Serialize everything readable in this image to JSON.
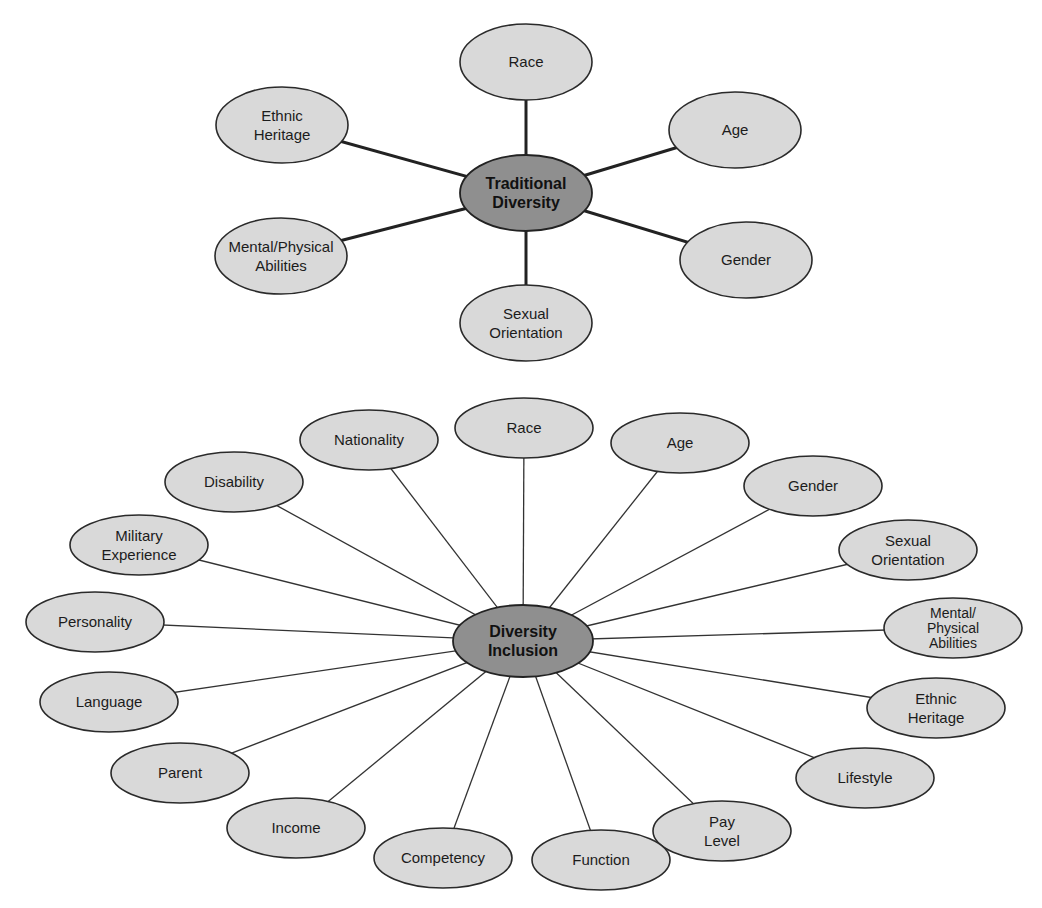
{
  "diagrams": [
    {
      "id": "traditional",
      "center": {
        "label": [
          "Traditional",
          "Diversity"
        ],
        "x": 526,
        "y": 193,
        "rx": 66,
        "ry": 38
      },
      "node_rx": 66,
      "node_ry": 38,
      "edge_style": "thick",
      "nodes": [
        {
          "label": [
            "Race"
          ],
          "x": 526,
          "y": 62
        },
        {
          "label": [
            "Ethnic",
            "Heritage"
          ],
          "x": 282,
          "y": 125
        },
        {
          "label": [
            "Age"
          ],
          "x": 735,
          "y": 130
        },
        {
          "label": [
            "Mental/Physical",
            "Abilities"
          ],
          "x": 281,
          "y": 256
        },
        {
          "label": [
            "Gender"
          ],
          "x": 746,
          "y": 260
        },
        {
          "label": [
            "Sexual",
            "Orientation"
          ],
          "x": 526,
          "y": 323
        }
      ]
    },
    {
      "id": "inclusion",
      "center": {
        "label": [
          "Diversity",
          "Inclusion"
        ],
        "x": 523,
        "y": 641,
        "rx": 70,
        "ry": 36
      },
      "node_rx": 69,
      "node_ry": 30,
      "edge_style": "thin",
      "nodes": [
        {
          "label": [
            "Race"
          ],
          "x": 524,
          "y": 428
        },
        {
          "label": [
            "Nationality"
          ],
          "x": 369,
          "y": 440
        },
        {
          "label": [
            "Age"
          ],
          "x": 680,
          "y": 443
        },
        {
          "label": [
            "Disability"
          ],
          "x": 234,
          "y": 482
        },
        {
          "label": [
            "Gender"
          ],
          "x": 813,
          "y": 486
        },
        {
          "label": [
            "Military",
            "Experience"
          ],
          "x": 139,
          "y": 545
        },
        {
          "label": [
            "Sexual",
            "Orientation"
          ],
          "x": 908,
          "y": 550
        },
        {
          "label": [
            "Personality"
          ],
          "x": 95,
          "y": 622
        },
        {
          "label": [
            "Mental/",
            "Physical",
            "Abilities"
          ],
          "x": 953,
          "y": 628
        },
        {
          "label": [
            "Language"
          ],
          "x": 109,
          "y": 702
        },
        {
          "label": [
            "Ethnic",
            "Heritage"
          ],
          "x": 936,
          "y": 708
        },
        {
          "label": [
            "Parent"
          ],
          "x": 180,
          "y": 773
        },
        {
          "label": [
            "Lifestyle"
          ],
          "x": 865,
          "y": 778
        },
        {
          "label": [
            "Income"
          ],
          "x": 296,
          "y": 828
        },
        {
          "label": [
            "Pay",
            "Level"
          ],
          "x": 722,
          "y": 831
        },
        {
          "label": [
            "Competency"
          ],
          "x": 443,
          "y": 858
        },
        {
          "label": [
            "Function"
          ],
          "x": 601,
          "y": 860
        }
      ]
    }
  ],
  "colors": {
    "node_fill": "#d9d9d9",
    "center_fill": "#8f8f8f",
    "stroke": "#2a2a2a"
  }
}
